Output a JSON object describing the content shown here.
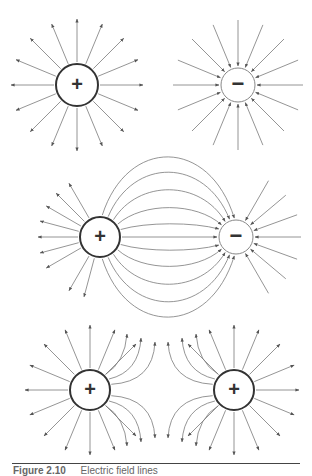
{
  "figure": {
    "caption_number": "Figure 2.10",
    "caption_text": "Electric field lines",
    "colors": {
      "line": "#6a6a6a",
      "charge_outline": "#333333",
      "background": "#ffffff"
    },
    "panels": [
      {
        "name": "isolated-positive-charge",
        "charges": [
          {
            "sign": "+",
            "symbol": "+",
            "cx": 77,
            "cy": 85,
            "r": 21
          }
        ],
        "field": "radially outward"
      },
      {
        "name": "isolated-negative-charge",
        "charges": [
          {
            "sign": "-",
            "symbol": "−",
            "cx": 238,
            "cy": 85,
            "r": 17
          }
        ],
        "field": "radially inward"
      },
      {
        "name": "dipole",
        "charges": [
          {
            "sign": "+",
            "symbol": "+",
            "cx": 100,
            "cy": 237,
            "r": 20
          },
          {
            "sign": "-",
            "symbol": "−",
            "cx": 236,
            "cy": 237,
            "r": 17
          }
        ],
        "field": "from positive to negative"
      },
      {
        "name": "two-positive-charges",
        "charges": [
          {
            "sign": "+",
            "symbol": "+",
            "cx": 90,
            "cy": 390,
            "r": 20
          },
          {
            "sign": "+",
            "symbol": "+",
            "cx": 234,
            "cy": 390,
            "r": 20
          }
        ],
        "field": "mutually repelling"
      }
    ]
  }
}
